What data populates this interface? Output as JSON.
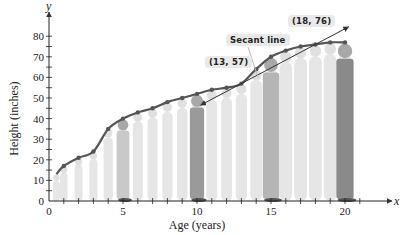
{
  "chart_data": {
    "type": "line",
    "title": "",
    "xlabel": "Age (years)",
    "ylabel": "Height (inches)",
    "x_axis_var": "x",
    "y_axis_var": "y",
    "xlim": [
      0,
      21
    ],
    "ylim": [
      0,
      85
    ],
    "x_ticks": [
      0,
      5,
      10,
      15,
      20
    ],
    "y_ticks": [
      0,
      10,
      20,
      30,
      40,
      50,
      60,
      70,
      80
    ],
    "grid": false,
    "series": [
      {
        "name": "Height",
        "x": [
          0.5,
          1,
          2,
          3,
          4,
          5,
          6,
          7,
          8,
          9,
          10,
          11,
          12,
          13,
          14,
          15,
          16,
          17,
          18,
          19,
          20
        ],
        "values": [
          13,
          17,
          21,
          24,
          35,
          40,
          43,
          45,
          48,
          50,
          52,
          54,
          55,
          57,
          64,
          70,
          73,
          75,
          76,
          77,
          77
        ]
      }
    ],
    "secant_line": {
      "label": "Secant line",
      "points": [
        [
          13,
          57
        ],
        [
          18,
          76
        ]
      ]
    },
    "annotations": [
      "(13, 57)",
      "(18, 76)",
      "Secant line"
    ]
  },
  "labels": {
    "point_a": "(13, 57)",
    "point_b": "(18, 76)",
    "secant": "Secant line"
  }
}
